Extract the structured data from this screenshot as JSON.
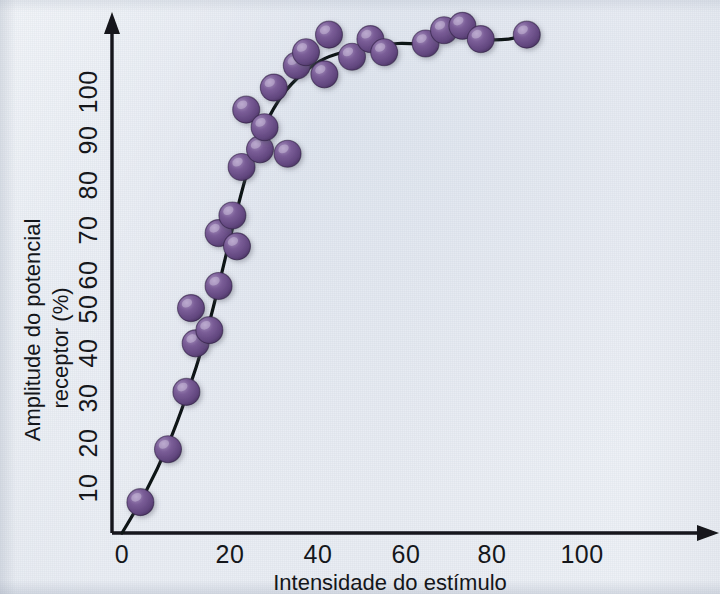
{
  "figure": {
    "background_color": "#e9edf3",
    "ink_color": "#14161a",
    "marker_color": "#6b4f87",
    "marker_highlight": "#9d86b5",
    "marker_shadow": "#4a3460"
  },
  "axes": {
    "y_title_line1": "Amplitude do potencial",
    "y_title_line2": "receptor (%)",
    "x_title": "Intensidade do estímulo",
    "y_tick_labels": [
      "10",
      "20",
      "30",
      "40",
      "50",
      "60",
      "70",
      "80",
      "90",
      "100"
    ],
    "x_tick_labels": [
      "0",
      "20",
      "40",
      "60",
      "80",
      "100"
    ]
  },
  "chart_data": {
    "type": "scatter",
    "title": "",
    "xlabel": "Intensidade do estímulo",
    "ylabel": "Amplitude do potencial receptor (%)",
    "xlim": [
      0,
      112
    ],
    "ylim": [
      0,
      118
    ],
    "xticks": [
      0,
      20,
      40,
      60,
      80,
      100
    ],
    "yticks": [
      10,
      20,
      30,
      40,
      50,
      60,
      70,
      80,
      90,
      100
    ],
    "grid": false,
    "legend": null,
    "series": [
      {
        "name": "Potencial receptor medido",
        "marker": "circle",
        "color": "#6b4f87",
        "points": [
          {
            "x": 4,
            "y": 7
          },
          {
            "x": 10,
            "y": 19
          },
          {
            "x": 14,
            "y": 32
          },
          {
            "x": 16,
            "y": 43
          },
          {
            "x": 15,
            "y": 51
          },
          {
            "x": 19,
            "y": 46
          },
          {
            "x": 21,
            "y": 56
          },
          {
            "x": 21,
            "y": 68
          },
          {
            "x": 24,
            "y": 72
          },
          {
            "x": 25,
            "y": 65
          },
          {
            "x": 26,
            "y": 83
          },
          {
            "x": 27,
            "y": 96
          },
          {
            "x": 30,
            "y": 87
          },
          {
            "x": 31,
            "y": 92
          },
          {
            "x": 33,
            "y": 101
          },
          {
            "x": 36,
            "y": 86
          },
          {
            "x": 38,
            "y": 106
          },
          {
            "x": 40,
            "y": 109
          },
          {
            "x": 44,
            "y": 104
          },
          {
            "x": 45,
            "y": 113
          },
          {
            "x": 50,
            "y": 108
          },
          {
            "x": 54,
            "y": 112
          },
          {
            "x": 57,
            "y": 109
          },
          {
            "x": 66,
            "y": 111
          },
          {
            "x": 70,
            "y": 114
          },
          {
            "x": 74,
            "y": 115
          },
          {
            "x": 78,
            "y": 112
          },
          {
            "x": 88,
            "y": 113
          }
        ]
      }
    ],
    "fit_curve": {
      "name": "Curva ajustada (saturação)",
      "description": "Curva sigmoide crescente que satura próximo de 113%",
      "points": [
        {
          "x": 0,
          "y": 0
        },
        {
          "x": 5,
          "y": 9
        },
        {
          "x": 10,
          "y": 20
        },
        {
          "x": 14,
          "y": 31
        },
        {
          "x": 18,
          "y": 44
        },
        {
          "x": 21,
          "y": 56
        },
        {
          "x": 24,
          "y": 69
        },
        {
          "x": 27,
          "y": 81
        },
        {
          "x": 30,
          "y": 90
        },
        {
          "x": 34,
          "y": 98
        },
        {
          "x": 38,
          "y": 103
        },
        {
          "x": 43,
          "y": 107
        },
        {
          "x": 48,
          "y": 109
        },
        {
          "x": 54,
          "y": 110
        },
        {
          "x": 60,
          "y": 111
        },
        {
          "x": 66,
          "y": 111
        },
        {
          "x": 71,
          "y": 113
        },
        {
          "x": 75,
          "y": 114
        },
        {
          "x": 79,
          "y": 112
        },
        {
          "x": 84,
          "y": 112
        },
        {
          "x": 88,
          "y": 113
        }
      ]
    }
  }
}
